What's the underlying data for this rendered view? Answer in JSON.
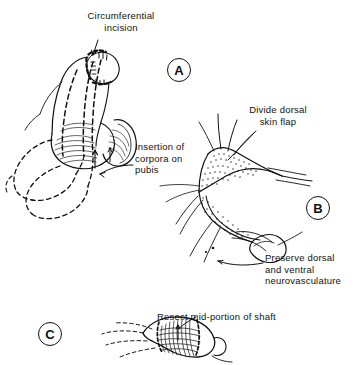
{
  "figure": {
    "background_color": "#ffffff",
    "ink_color": "#111111"
  },
  "panels": [
    {
      "id": "A",
      "letter": "A",
      "x": 167,
      "y": 58,
      "subject": "penis-with-circumferential-incision-and-corpora-dashed-outline"
    },
    {
      "id": "B",
      "letter": "B",
      "x": 306,
      "y": 196,
      "subject": "degloved-shaft-with-dorsal-skin-flap-and-neurovascular-bundle"
    },
    {
      "id": "C",
      "letter": "C",
      "x": 38,
      "y": 322,
      "subject": "shaft-with-mid-portion-resection-segment"
    }
  ],
  "annotations": [
    {
      "name": "circumferential-incision",
      "text": "Circumferential\nincision",
      "x": 63,
      "y": 10,
      "width": 116,
      "align": "center"
    },
    {
      "name": "insertion-of-corpora-on-pubis",
      "text": "Insertion of\ncorpora on\npubis",
      "x": 135,
      "y": 141,
      "width": 100,
      "align": "left"
    },
    {
      "name": "divide-dorsal-skin-flap",
      "text": "Divide dorsal\nskin flap",
      "x": 226,
      "y": 104,
      "width": 104,
      "align": "center"
    },
    {
      "name": "preserve-dorsal-and-ventral-neurovasculature",
      "text": "Preserve dorsal\nand ventral\nneurovasculature",
      "x": 265,
      "y": 252,
      "width": 96,
      "align": "left"
    },
    {
      "name": "resect-mid-portion-of-shaft",
      "text": "Resect mid-portion of shaft",
      "x": 157,
      "y": 311,
      "width": 160,
      "align": "left"
    }
  ]
}
